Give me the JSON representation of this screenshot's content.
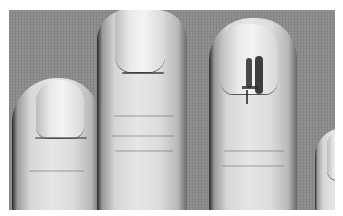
{
  "image": {
    "description": "Grayscale clinical photograph of fingertips against a grey textured fabric background, showing fingernails with a dark streaked discoloration on the third nail",
    "colors": {
      "background": "#8c8c8c",
      "skin": "#dcdcdc",
      "nail": "#ececec",
      "lesion": "#2a2a2a",
      "border": "#ffffff"
    }
  }
}
